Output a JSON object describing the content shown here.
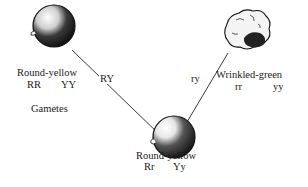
{
  "diagram": {
    "parents": [
      {
        "phenotype": "Round-yellow",
        "genotype": [
          "RR",
          "YY"
        ],
        "shape": "round"
      },
      {
        "phenotype": "Wrinkled-green",
        "genotype": [
          "rr",
          "yy"
        ],
        "shape": "wrinkled"
      }
    ],
    "gametes_label": "Gametes",
    "gametes": [
      "RY",
      "ry"
    ],
    "offspring": {
      "phenotype": "Round-yellow",
      "genotype": [
        "Rr",
        "Yy"
      ],
      "shape": "round"
    }
  }
}
